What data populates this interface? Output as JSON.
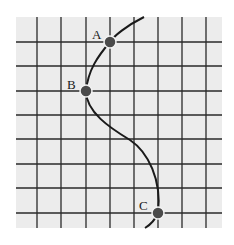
{
  "diagram": {
    "type": "grid-with-curve",
    "colors": {
      "background": "#ffffff",
      "grid_fill": "#ececec",
      "grid_line": "#2a2a2a",
      "curve": "#1a1a1a",
      "point_fill": "#4a4a4a",
      "point_stroke": "#f2f2f2",
      "label": "#1a1a1a"
    },
    "grid": {
      "x0": 16,
      "y0": 17,
      "x1": 222,
      "y1": 228,
      "vertical_lines": [
        37,
        61,
        86,
        110,
        134,
        158,
        182,
        206
      ],
      "horizontal_lines": [
        42,
        66,
        91,
        115,
        139,
        164,
        188,
        213
      ]
    },
    "curve": {
      "path": "M 144 17 C 126 26, 114 36, 110 42 C 98 56, 88 70, 86 91 C 86 112, 110 128, 130 140 C 148 152, 162 180, 158 213 C 155 220, 150 225, 145 228"
    },
    "points": [
      {
        "label": "A",
        "x": 110,
        "y": 42,
        "label_x": 92,
        "label_y": 39
      },
      {
        "label": "B",
        "x": 86,
        "y": 91,
        "label_x": 67,
        "label_y": 89
      },
      {
        "label": "C",
        "x": 158,
        "y": 213,
        "label_x": 139,
        "label_y": 210
      }
    ]
  }
}
